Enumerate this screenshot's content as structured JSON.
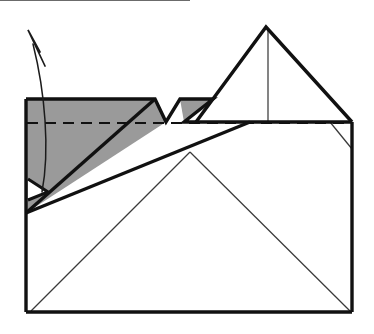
{
  "figure": {
    "kind": "line-drawing",
    "caption": "",
    "background_color": "#ffffff"
  },
  "palette": {
    "paper_white": "#ffffff",
    "shaded_gray": "#9a9a9a",
    "ink_black": "#111111",
    "crease_gray": "#3a3a3a"
  },
  "canvas": {
    "width": 374,
    "height": 334
  },
  "sheet": {
    "name": "main-rectangle",
    "left": 26,
    "top": 122,
    "right": 352,
    "bottom": 312,
    "outline_points": "26,122 352,122 352,312 26,312"
  },
  "shapes": {
    "shaded_flap": {
      "label": "shaded-flap-region",
      "points": "26,99 155,99 166,122 180,99 196,99 196,99 250,122 26,213",
      "fill": "#9a9a9a"
    },
    "shaded_notch_triangle": {
      "label": "shaded-notch-triangle",
      "points": "180,99 213,99 184,122"
    },
    "shaded_flap_body": {
      "label": "shaded-flap-body",
      "points": "26,99 155,99 166,122 26,213"
    },
    "top_peak_triangle": {
      "label": "top-peak-triangle",
      "points": "266,27 352,122 196,122",
      "apex_x": 266,
      "apex_y": 27
    },
    "small_white_triangle": {
      "label": "small-white-triangle",
      "points": "28,179 48,192 28,200"
    },
    "lower_thick_band": {
      "label": "lower-thick-crease",
      "from": "26,213",
      "to": "250,122"
    },
    "upper_thick_crease": {
      "label": "upper-thick-crease",
      "from": "26,213",
      "to": "155,99"
    }
  },
  "creases": {
    "dashed_valley": {
      "label": "dashed-valley-fold-line",
      "style": "dashed",
      "from_x": 27,
      "from_y": 123,
      "to_x": 352,
      "to_y": 123
    },
    "vertical_center": {
      "label": "vertical-center-crease",
      "from_x": 268,
      "from_y": 29,
      "to_x": 268,
      "to_y": 122
    },
    "v_left_leg": {
      "label": "v-crease-left-leg",
      "from_x": 190,
      "from_y": 152,
      "to_x": 31,
      "to_y": 311
    },
    "v_right_leg": {
      "label": "v-crease-right-leg",
      "from_x": 190,
      "from_y": 152,
      "to_x": 350,
      "to_y": 311
    },
    "corner_diagonal": {
      "label": "right-corner-diagonal-crease",
      "from_x": 330,
      "from_y": 122,
      "to_x": 352,
      "to_y": 149
    }
  },
  "arrow": {
    "label": "unfold-arrow",
    "meaning": "unfold-upward",
    "shaft_path": "M 42,192 C 48,150 44,92 34,46",
    "head_tip_x": 28,
    "head_tip_y": 30,
    "head_path": "M 44,64 L 28,30 M 28,30 L 41,50",
    "color": "#1b1b1b"
  }
}
